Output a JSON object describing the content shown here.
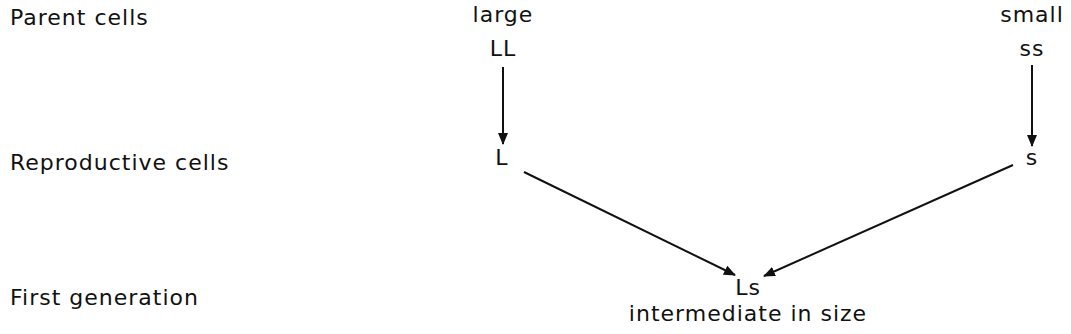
{
  "rows": {
    "parent": "Parent cells",
    "reproductive": "Reproductive cells",
    "first_generation": "First generation"
  },
  "left_parent": {
    "descriptor": "large",
    "genotype": "LL",
    "gamete": "L"
  },
  "right_parent": {
    "descriptor": "small",
    "genotype": "ss",
    "gamete": "s"
  },
  "offspring": {
    "genotype": "Ls",
    "descriptor": "intermediate in size"
  },
  "colors": {
    "ink": "#111111",
    "background": "#ffffff"
  }
}
